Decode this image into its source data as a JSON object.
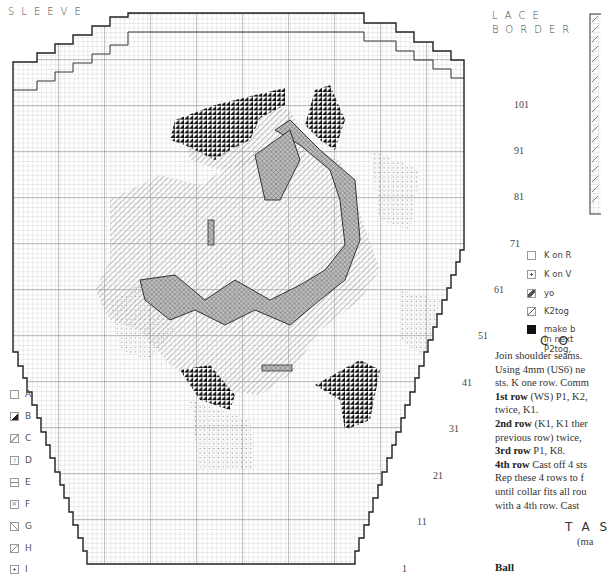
{
  "sleeve": {
    "title": "SLEEVE",
    "row_numbers": [
      "101",
      "91",
      "81",
      "71",
      "61",
      "51",
      "41",
      "31",
      "21",
      "11",
      "1"
    ]
  },
  "lace_border": {
    "title_line1": "LACE",
    "title_line2": "BORDER"
  },
  "key_left": [
    {
      "symbol": "blank-square",
      "label": "A"
    },
    {
      "symbol": "half-filled-square",
      "label": "B"
    },
    {
      "symbol": "dotted-diagonal-square",
      "label": "C"
    },
    {
      "symbol": "question-square",
      "label": "D"
    },
    {
      "symbol": "dash-square",
      "label": "E"
    },
    {
      "symbol": "cross-square",
      "label": "F"
    },
    {
      "symbol": "backslash-square",
      "label": "G"
    },
    {
      "symbol": "slash-square",
      "label": "H"
    },
    {
      "symbol": "dot-square",
      "label": "I"
    }
  ],
  "key_right": [
    {
      "symbol": "blank-square",
      "label": "K on R"
    },
    {
      "symbol": "dot-square",
      "label": "K on V"
    },
    {
      "symbol": "yo-square",
      "label": "yo"
    },
    {
      "symbol": "slash-square",
      "label": "K2tog"
    },
    {
      "symbol": "filled-square",
      "label_lines": [
        "make b",
        "in next",
        "P2tog,"
      ]
    }
  ],
  "collar": {
    "heading": "CO",
    "lines": [
      {
        "bold": "",
        "text": "Join shoulder seams."
      },
      {
        "bold": "",
        "text": "Using 4mm (US6) ne"
      },
      {
        "bold": "",
        "text": "sts. K one row. Comm"
      },
      {
        "bold": "1st row",
        "text": " (WS) P1, K2,"
      },
      {
        "bold": "",
        "text": "twice, K1."
      },
      {
        "bold": "2nd row",
        "text": " (K1, K1 ther"
      },
      {
        "bold": "",
        "text": "previous row) twice,"
      },
      {
        "bold": "3rd row",
        "text": " P1, K8."
      },
      {
        "bold": "4th row",
        "text": " Cast off 4 sts"
      },
      {
        "bold": "",
        "text": "Rep these 4 rows to f"
      },
      {
        "bold": "",
        "text": "until collar fits all rou"
      },
      {
        "bold": "",
        "text": "with a 4th row. Cast"
      }
    ]
  },
  "tassel": {
    "heading": "TAS",
    "subnote": "(ma",
    "ball_label": "Ball"
  },
  "colors": {
    "grid_line": "#b8b8b8",
    "grid_major": "#555555",
    "outline": "#222222",
    "motif_dark": "#1a1a1a",
    "motif_mid": "#8a8a8a",
    "motif_light": "#c4c4c4"
  }
}
